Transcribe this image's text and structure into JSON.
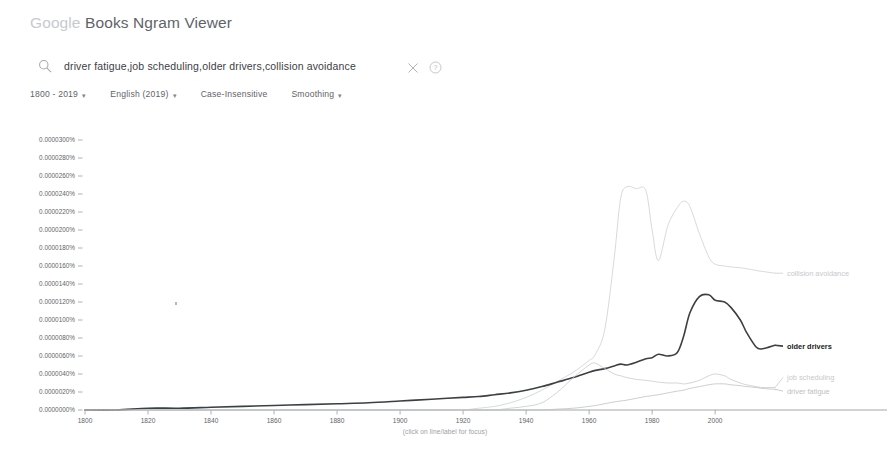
{
  "header": {
    "brand": "Google",
    "product": " Books Ngram Viewer"
  },
  "search": {
    "value": "driver fatigue,job scheduling,older drivers,collision avoidance",
    "placeholder": "Enter comma-separated phrases",
    "search_icon": "search-icon",
    "clear_icon": "close-icon",
    "help_icon": "help-circle-icon"
  },
  "options": [
    {
      "label": "1800 - 2019",
      "caret": "▾",
      "has_caret": true
    },
    {
      "label": "English (2019)",
      "caret": "▾",
      "has_caret": true
    },
    {
      "label": "Case-Insensitive",
      "caret": "",
      "has_caret": false
    },
    {
      "label": "Smoothing",
      "caret": "▾",
      "has_caret": true
    }
  ],
  "footnote": "(click on line/label for focus)",
  "chart_data": {
    "type": "line",
    "title": "",
    "xlabel": "",
    "ylabel": "",
    "grid": false,
    "legend_position": "right-inline",
    "xlim": [
      1800,
      2019
    ],
    "ylim": [
      0,
      3e-05
    ],
    "xticks": [
      1800,
      1820,
      1840,
      1860,
      1880,
      1900,
      1920,
      1940,
      1960,
      1980,
      2000
    ],
    "xticklabels": [
      "1800",
      "1820",
      "1840",
      "1860",
      "1880",
      "1900",
      "1920",
      "1940",
      "1960",
      "1980",
      "2000"
    ],
    "yticks": [
      0.0,
      2e-06,
      4e-06,
      6e-06,
      8e-06,
      1e-05,
      1.2e-05,
      1.4e-05,
      1.6e-05,
      1.8e-05,
      2e-05,
      2.2e-05,
      2.4e-05,
      2.6e-05,
      2.8e-05,
      3e-05
    ],
    "yticklabels": [
      "0.0000000%",
      "0.0000020%",
      "0.0000040%",
      "0.0000060%",
      "0.0000080%",
      "0.0000100%",
      "0.0000120%",
      "0.0000140%",
      "0.0000160%",
      "0.0000180%",
      "0.0000200%",
      "0.0000220%",
      "0.0000240%",
      "0.0000260%",
      "0.0000280%",
      "0.0000300%"
    ],
    "x": [
      1800,
      1810,
      1820,
      1830,
      1840,
      1850,
      1860,
      1870,
      1880,
      1890,
      1900,
      1905,
      1910,
      1915,
      1920,
      1925,
      1930,
      1935,
      1940,
      1945,
      1950,
      1955,
      1960,
      1962,
      1965,
      1968,
      1970,
      1972,
      1975,
      1978,
      1980,
      1982,
      1985,
      1988,
      1990,
      1992,
      1995,
      1998,
      2000,
      2003,
      2005,
      2008,
      2010,
      2013,
      2015,
      2019
    ],
    "series": [
      {
        "name": "collision avoidance",
        "label": "collision avoidance",
        "color": "#c6c9cc",
        "width": 0.7,
        "label_y": 1.52e-05,
        "values": [
          0.0,
          0.0,
          0.0,
          0.0,
          0.0,
          0.0,
          0.0,
          0.0,
          0.0,
          0.0,
          0.0,
          0.0,
          0.0,
          0.0,
          0.0,
          2e-07,
          4e-07,
          8e-07,
          1.4e-06,
          2.2e-06,
          3.2e-06,
          4.2e-06,
          5.5e-06,
          6.2e-06,
          9e-06,
          1.7e-05,
          2.35e-05,
          2.48e-05,
          2.46e-05,
          2.44e-05,
          2e-05,
          1.66e-05,
          2.05e-05,
          2.25e-05,
          2.32e-05,
          2.26e-05,
          1.96e-05,
          1.7e-05,
          1.62e-05,
          1.6e-05,
          1.59e-05,
          1.58e-05,
          1.57e-05,
          1.55e-05,
          1.54e-05,
          1.52e-05
        ]
      },
      {
        "name": "older drivers",
        "label": "older drivers",
        "color": "#3c4043",
        "width": 1.6,
        "label_y": 7.1e-06,
        "values": [
          0.0,
          0.0,
          2e-07,
          2e-07,
          3e-07,
          4e-07,
          5e-07,
          6e-07,
          7e-07,
          8e-07,
          1e-06,
          1.1e-06,
          1.2e-06,
          1.3e-06,
          1.4e-06,
          1.5e-06,
          1.7e-06,
          1.9e-06,
          2.2e-06,
          2.6e-06,
          3.1e-06,
          3.6e-06,
          4.2e-06,
          4.4e-06,
          4.6e-06,
          4.9e-06,
          5.1e-06,
          5e-06,
          5.3e-06,
          5.7e-06,
          5.8e-06,
          6.2e-06,
          6e-06,
          6.4e-06,
          8.2e-06,
          1.08e-05,
          1.26e-05,
          1.28e-05,
          1.22e-05,
          1.2e-05,
          1.14e-05,
          1e-05,
          8.6e-06,
          7e-06,
          6.8e-06,
          7.2e-06
        ]
      },
      {
        "name": "job scheduling",
        "label": "job scheduling",
        "color": "#c6c9cc",
        "width": 0.8,
        "label_y": 3.6e-06,
        "values": [
          0.0,
          0.0,
          0.0,
          0.0,
          0.0,
          0.0,
          0.0,
          0.0,
          0.0,
          0.0,
          0.0,
          0.0,
          0.0,
          0.0,
          0.0,
          0.0,
          0.0,
          2e-07,
          4e-07,
          8e-07,
          2e-06,
          3.6e-06,
          5e-06,
          5.2e-06,
          4.6e-06,
          4e-06,
          3.8e-06,
          3.6e-06,
          3.4e-06,
          3.3e-06,
          3.2e-06,
          3.1e-06,
          3e-06,
          3e-06,
          2.9e-06,
          3e-06,
          3.3e-06,
          3.8e-06,
          4e-06,
          3.8e-06,
          3.4e-06,
          3e-06,
          2.8e-06,
          2.6e-06,
          2.5e-06,
          2.5e-06
        ]
      },
      {
        "name": "driver fatigue",
        "label": "driver fatigue",
        "color": "#bdc0c3",
        "width": 0.8,
        "label_y": 2.1e-06,
        "values": [
          0.0,
          0.0,
          0.0,
          0.0,
          0.0,
          0.0,
          0.0,
          0.0,
          0.0,
          0.0,
          0.0,
          0.0,
          0.0,
          0.0,
          0.0,
          0.0,
          0.0,
          0.0,
          0.0,
          0.0,
          1e-07,
          2e-07,
          4e-07,
          5e-07,
          7e-07,
          9e-07,
          1e-06,
          1.1e-06,
          1.3e-06,
          1.5e-06,
          1.6e-06,
          1.7e-06,
          1.9e-06,
          2.1e-06,
          2.2e-06,
          2.4e-06,
          2.6e-06,
          2.8e-06,
          2.9e-06,
          2.9e-06,
          2.8e-06,
          2.7e-06,
          2.6e-06,
          2.5e-06,
          2.4e-06,
          2.3e-06
        ]
      }
    ],
    "axis_color": "#5f6368",
    "annotations": []
  }
}
